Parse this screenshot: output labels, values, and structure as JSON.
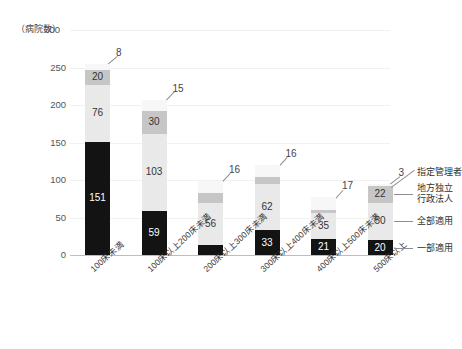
{
  "chart_data": {
    "type": "bar",
    "title": "",
    "ylabel": "（病院数）",
    "xlabel": "",
    "ylim": [
      0,
      300
    ],
    "yticks": [
      0,
      50,
      100,
      150,
      200,
      250,
      300
    ],
    "grid": true,
    "stacked": true,
    "legend_position": "right",
    "categories": [
      "100床未満",
      "100床以上200床未満",
      "200床以上300床未満",
      "300床以上400床未満",
      "400床以上500床未満",
      "500床以上"
    ],
    "series": [
      {
        "name": "一部適用",
        "values": [
          151,
          59,
          14,
          33,
          21,
          20
        ],
        "color": "#131313"
      },
      {
        "name": "全部適用",
        "values": [
          76,
          103,
          56,
          62,
          35,
          50
        ],
        "color": "#e9e9e9"
      },
      {
        "name": "地方独立行政法人",
        "values": [
          20,
          30,
          13,
          9,
          4,
          22
        ],
        "color": "#c6c6c6"
      },
      {
        "name": "指定管理者",
        "values": [
          8,
          15,
          16,
          16,
          17,
          3
        ],
        "color": "#f7f7f7"
      }
    ],
    "totals": [
      255,
      207,
      99,
      120,
      77,
      95
    ],
    "legend_entries": [
      {
        "label": "指定管理者",
        "label_line2": ""
      },
      {
        "label": "地方独立",
        "label_line2": "行政法人"
      },
      {
        "label": "全部適用",
        "label_line2": ""
      },
      {
        "label": "一部適用",
        "label_line2": ""
      }
    ]
  }
}
